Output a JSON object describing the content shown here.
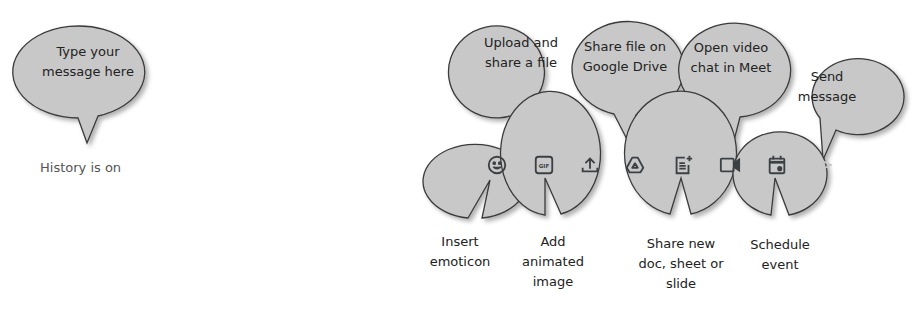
{
  "composer": {
    "history_status": "History is on"
  },
  "toolbar": {
    "icons": [
      {
        "name": "emoji-icon",
        "label": "Insert emoticon"
      },
      {
        "name": "gif-icon",
        "label": "Add animated image",
        "glyph": "GIF"
      },
      {
        "name": "upload-icon",
        "label": "Upload and share a file"
      },
      {
        "name": "google-drive-icon",
        "label": "Share file on Google Drive"
      },
      {
        "name": "new-doc-icon",
        "label": "Share new doc, sheet or slide"
      },
      {
        "name": "meet-video-icon",
        "label": "Open video chat in Meet"
      },
      {
        "name": "calendar-event-icon",
        "label": "Schedule event"
      },
      {
        "name": "send-icon",
        "label": "Send message"
      }
    ]
  },
  "callouts": {
    "message": "Type your message here",
    "upload": "Upload and share a file",
    "drive": "Share file on Google Drive",
    "meet": "Open video chat in Meet",
    "send": "Send message",
    "emoticon": "Insert emoticon",
    "gif": "Add animated image",
    "doc": "Share new doc, sheet or slide",
    "schedule": "Schedule event"
  },
  "colors": {
    "bubble_fill": "#c8c8c8",
    "bubble_stroke": "#3a3a3a",
    "icon": "#3c4043",
    "send_disabled": "#c8c8c8"
  }
}
